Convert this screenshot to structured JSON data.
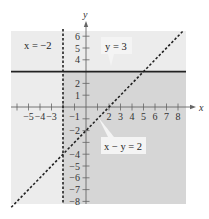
{
  "chart_data": {
    "type": "line",
    "title": "",
    "xlabel": "x",
    "ylabel": "y",
    "xlim": [
      -6.5,
      8.7
    ],
    "ylim": [
      -8.4,
      6.6
    ],
    "x_ticks": [
      -5,
      -4,
      -3,
      -1,
      2,
      3,
      4,
      5,
      6,
      7,
      8
    ],
    "x_tick_labels": [
      "−5",
      "−4",
      "−3",
      "−1",
      "2",
      "3",
      "4",
      "5",
      "6",
      "7",
      "8"
    ],
    "y_ticks": [
      6,
      5,
      4,
      2,
      1,
      -2,
      -4,
      -5,
      -6,
      -7,
      -8
    ],
    "y_tick_labels": [
      "6",
      "5",
      "4",
      "2",
      "1",
      "−2",
      "−4",
      "−5",
      "−6",
      "−7",
      "−8"
    ],
    "series": [
      {
        "name": "x = −2",
        "style": "dashed",
        "kind": "vertical",
        "x": -2
      },
      {
        "name": "y = 3",
        "style": "solid",
        "kind": "horizontal",
        "y": 3
      },
      {
        "name": "x − y = 2",
        "style": "dashed",
        "kind": "line",
        "slope": 1,
        "intercept": -2,
        "points": [
          [
            -6.5,
            -8.5
          ],
          [
            8.5,
            6.5
          ]
        ]
      }
    ],
    "shaded_region": "x > −2 and y < 3 (darker gray); other regions lighter gray",
    "annotations": [
      {
        "text": "x = −2",
        "position": "upper-left"
      },
      {
        "text": "y = 3",
        "position": "upper-right callout"
      },
      {
        "text": "x − y = 2",
        "position": "lower-right callout"
      }
    ],
    "grid": false,
    "legend": "none"
  },
  "labels": {
    "x_axis": "x",
    "y_axis": "y",
    "eq_vertical": "x = −2",
    "eq_horizontal": "y = 3",
    "eq_diagonal": "x − y = 2"
  },
  "colors": {
    "shade_light": "#ececec",
    "shade_dark": "#d6d6d6",
    "line": "#222222",
    "axis": "#666666"
  }
}
